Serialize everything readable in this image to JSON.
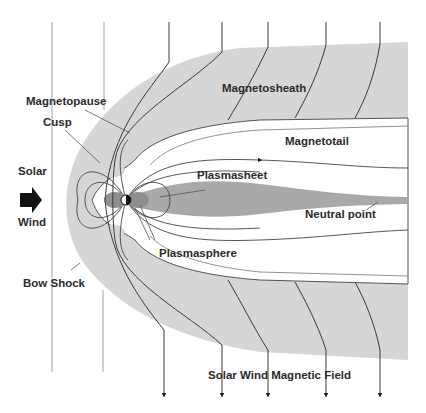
{
  "diagram": {
    "colors": {
      "background": "#ffffff",
      "sheath": "#d6d6d6",
      "plasmasheet": "#a9a9a9",
      "plasmasphere": "#8e8e8e",
      "field_line": "#3a3a3a",
      "solar_wind_line": "#9a9a9a",
      "text": "#2b2b2b",
      "arrow": "#1a1a1a"
    },
    "labels": {
      "magnetosheath": "Magnetosheath",
      "magnetopause": "Magnetopause",
      "cusp": "Cusp",
      "magnetotail": "Magnetotail",
      "solar": "Solar",
      "wind": "Wind",
      "plasmasheet": "Plasmasheet",
      "neutral_point": "Neutral point",
      "plasmasphere": "Plasmasphere",
      "bow_shock": "Bow Shock",
      "solar_wind_magnetic_field": "Solar Wind Magnetic Field"
    },
    "icons": {
      "solar_wind_arrow": "right-arrow"
    }
  }
}
